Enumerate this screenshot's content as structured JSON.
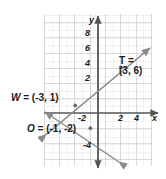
{
  "figure": {
    "type": "coordinate-plane-diagram",
    "background": "#ffffff",
    "grid_color": "#d8d8d8",
    "axis_color": "#555555",
    "line_color": "#8a8a8a",
    "text_color": "#1a1a1a"
  },
  "axes": {
    "x_name": "x",
    "y_name": "y",
    "origin_px": [
      98,
      113
    ],
    "unit_px": 7.6,
    "x_range": [
      -7,
      7
    ],
    "y_range": [
      -7,
      9
    ],
    "x_ticks": [
      {
        "label": "-2",
        "value": -2
      },
      {
        "label": "2",
        "value": 2
      },
      {
        "label": "4",
        "value": 4
      }
    ],
    "y_ticks": [
      {
        "label": "8",
        "value": 8
      },
      {
        "label": "6",
        "value": 6
      },
      {
        "label": "4",
        "value": 4
      },
      {
        "label": "2",
        "value": 2
      },
      {
        "label": "-4",
        "value": -4
      }
    ]
  },
  "points": [
    {
      "name": "W",
      "label": "W = (-3, 1)",
      "name_text": "W",
      "coord_text": " = (-3, 1)",
      "x": -3,
      "y": 1
    },
    {
      "name": "T",
      "label": "T = (3, 6)",
      "line1": "T =",
      "line2": "(3, 6)",
      "x": 3,
      "y": 6
    },
    {
      "name": "O",
      "label": "O = (-1, -2)",
      "name_text": "O",
      "coord_text": " = (-1, -2)",
      "x": -1,
      "y": -2
    }
  ],
  "lines": [
    {
      "id": "rising-line",
      "description": "line through W(-3,1) and T(3,6) with arrowheads at both ends",
      "slope": 0.833,
      "intercept": 3.5,
      "through": [
        "W",
        "T"
      ],
      "arrows": "both"
    },
    {
      "id": "falling-line",
      "description": "line through W(-3,1) and O(-1,-2) with arrowheads at both ends",
      "slope": -1.5,
      "intercept": -3.5,
      "through": [
        "W",
        "O"
      ],
      "arrows": "both"
    }
  ]
}
